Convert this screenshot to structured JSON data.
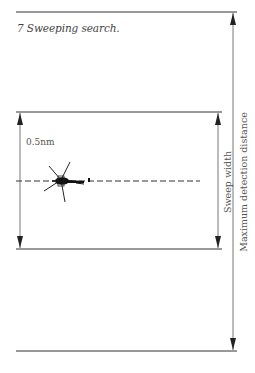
{
  "figure": {
    "number": "7",
    "caption": "7 Sweeping search.",
    "labels": {
      "distance": "0.5nm",
      "sweep_width": "Sweep width",
      "max_detection": "Maximum detection distance"
    },
    "colors": {
      "line": "#333333",
      "text": "#555555",
      "background": "#ffffff"
    },
    "elements": {
      "helicopter": "helicopter-icon",
      "track": "dashed-search-track",
      "arrows": [
        "sweep-width-arrow",
        "max-detection-arrow",
        "half-sweep-arrow"
      ]
    }
  }
}
